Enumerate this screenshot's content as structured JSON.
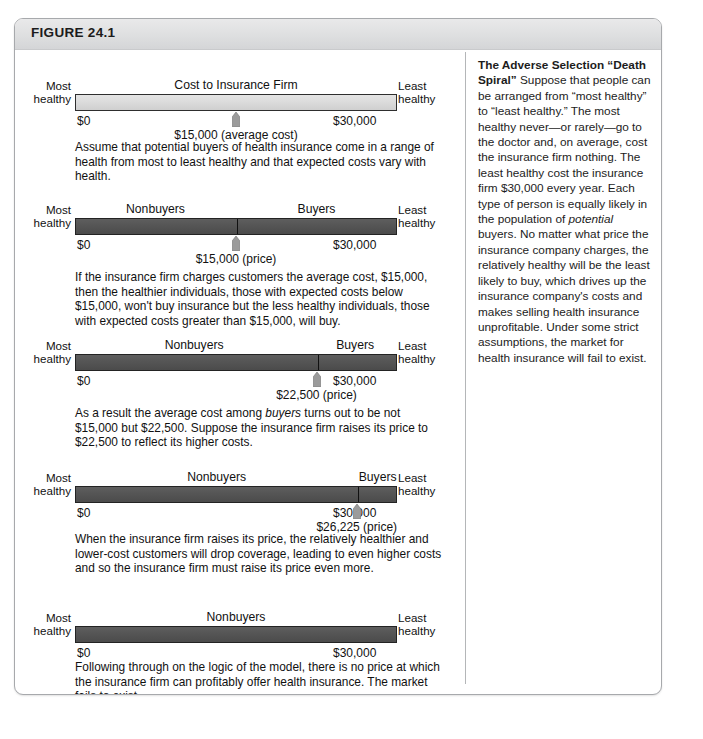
{
  "figure": {
    "label": "FIGURE 24.1"
  },
  "axis": {
    "left_label_line1": "Most",
    "left_label_line2": "healthy",
    "right_label_line1": "Least",
    "right_label_line2": "healthy",
    "tick_min": "$0",
    "tick_max": "$30,000"
  },
  "panels": [
    {
      "id": "panel-1",
      "bar_style": "light",
      "bar_title": "Cost to Insurance Firm",
      "segments": [],
      "divider_pct": null,
      "marker_pct": 50,
      "marker_label": "$15,000 (average cost)",
      "description": "Assume that potential buyers of health insurance come in a range of health from most to least healthy and that expected costs vary with health."
    },
    {
      "id": "panel-2",
      "bar_style": "dark",
      "bar_title": null,
      "segments": [
        {
          "label": "Nonbuyers",
          "center_pct": 25
        },
        {
          "label": "Buyers",
          "center_pct": 75
        }
      ],
      "divider_pct": 50,
      "marker_pct": 50,
      "marker_label": "$15,000 (price)",
      "description": "If the insurance firm charges customers the average cost, $15,000, then the healthier individuals, those with expected costs below $15,000, won't buy insurance but the less healthy individuals, those with expected costs greater than $15,000, will buy."
    },
    {
      "id": "panel-3",
      "bar_style": "dark",
      "bar_title": null,
      "segments": [
        {
          "label": "Nonbuyers",
          "center_pct": 37
        },
        {
          "label": "Buyers",
          "center_pct": 87
        }
      ],
      "divider_pct": 75,
      "marker_pct": 75,
      "marker_label": "$22,500 (price)",
      "description": "As a result the average cost among buyers turns out to be not $15,000 but $22,500. Suppose the insurance firm raises its price to $22,500 to reflect its higher costs."
    },
    {
      "id": "panel-4",
      "bar_style": "dark",
      "bar_title": null,
      "segments": [
        {
          "label": "Nonbuyers",
          "center_pct": 44
        },
        {
          "label": "Buyers",
          "center_pct": 94
        }
      ],
      "divider_pct": 87.5,
      "marker_pct": 87.5,
      "marker_label": "$26,225 (price)",
      "description": "When the insurance firm raises its price, the relatively healthier and lower-cost customers will drop coverage, leading to even higher costs and so the insurance firm must raise its price even more."
    },
    {
      "id": "panel-5",
      "bar_style": "dark",
      "bar_title": null,
      "segments": [
        {
          "label": "Nonbuyers",
          "center_pct": 50
        }
      ],
      "divider_pct": null,
      "marker_pct": null,
      "marker_label": null,
      "description": "Following through on the logic of the model, there is no price at which the insurance firm can profitably offer health insurance. The market fails to exist."
    }
  ],
  "sidebar": {
    "lead": "The Adverse Selection “Death Spiral”",
    "body_part1": " Suppose that people can be arranged from “most healthy” to “least healthy.” The most healthy never—or rarely—go to the doctor and, on average, cost the insurance firm nothing. The least healthy cost the insurance firm $30,000 every year. Each type of person is equally likely in the population of ",
    "body_italic": "potential",
    "body_part2": " buyers. No matter what price the insurance company charges, the relatively healthy will be the least likely to buy, which drives up the insurance company's costs and makes selling health insurance unprofitable. Under some strict assumptions, the market for health insurance will fail to exist."
  },
  "colors": {
    "bar_light": "#dcdcdc",
    "bar_dark": "#555555",
    "header_band": "#e1e2e3",
    "marker": "#9b9b9b",
    "frame": "#a7a9ac"
  }
}
